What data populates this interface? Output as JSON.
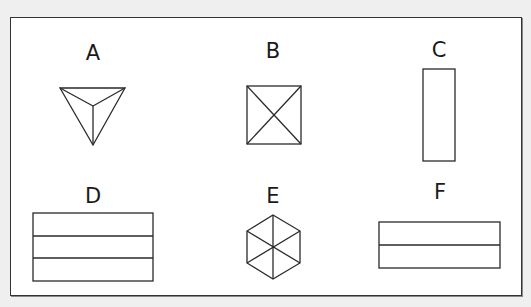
{
  "figure": {
    "frame": {
      "stroke": "#333333",
      "fill": "#ffffff"
    },
    "background": "#efefef",
    "items": [
      {
        "label": "A",
        "shape": "triangle-pyramid-top-view",
        "description": "Downward-pointing triangle with lines from each vertex to the center"
      },
      {
        "label": "B",
        "shape": "square-with-diagonals",
        "description": "Square with both diagonals drawn"
      },
      {
        "label": "C",
        "shape": "tall-rectangle",
        "description": "Narrow vertical rectangle"
      },
      {
        "label": "D",
        "shape": "rectangle-three-bands",
        "description": "Wide rectangle divided into three horizontal bands"
      },
      {
        "label": "E",
        "shape": "hexagon-with-spokes",
        "description": "Hexagon with lines from each vertex to the center"
      },
      {
        "label": "F",
        "shape": "rectangle-two-bands",
        "description": "Wide rectangle divided into two horizontal bands"
      }
    ]
  }
}
